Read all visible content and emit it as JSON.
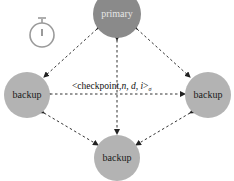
{
  "diagram": {
    "timer_icon": "stopwatch-icon",
    "nodes": [
      {
        "id": "primary",
        "label": "primary",
        "color": "#8a8a8a",
        "text_color": "#e6e6e6"
      },
      {
        "id": "backup_left",
        "label": "backup",
        "color": "#b3b3b3",
        "text_color": "#1a1a1a"
      },
      {
        "id": "backup_right",
        "label": "backup",
        "color": "#b3b3b3",
        "text_color": "#1a1a1a"
      },
      {
        "id": "backup_bottom",
        "label": "backup",
        "color": "#b3b3b3",
        "text_color": "#1a1a1a"
      }
    ],
    "message": {
      "prefix": "<checkpoint,",
      "vars": "n, d, i",
      "suffix": ">",
      "subscript": "σ"
    }
  }
}
